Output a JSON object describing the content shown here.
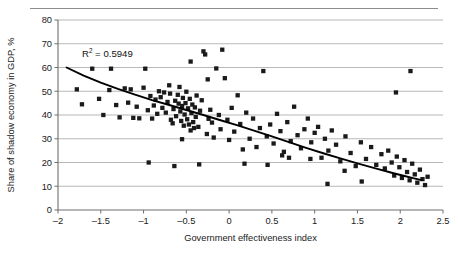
{
  "figure": {
    "top_rule": true,
    "annotation": {
      "r2_prefix": "R",
      "r2_sup": "2",
      "r2_value": "= 0.5949",
      "full_text": "R2 = 0.5949"
    }
  },
  "chart_data": {
    "type": "scatter",
    "title": "",
    "xlabel": "Government effectiveness index",
    "ylabel": "Share of shadow economy in GDP, %",
    "xlim": [
      -2,
      2.5
    ],
    "ylim": [
      0,
      80
    ],
    "xticks": [
      -2,
      -1.5,
      -1,
      -0.5,
      0,
      0.5,
      1,
      1.5,
      2,
      2.5
    ],
    "xticklabels": [
      "–2",
      "–1.5",
      "–1",
      "–0.5",
      "0",
      "0.5",
      "1",
      "1.5",
      "2",
      "2.5"
    ],
    "yticks": [
      0,
      10,
      20,
      30,
      40,
      50,
      60,
      70,
      80
    ],
    "yticklabels": [
      "0",
      "10",
      "20",
      "30",
      "40",
      "50",
      "60",
      "70",
      "80"
    ],
    "grid": "horizontal",
    "legend": "none",
    "marker": "square",
    "marker_color": "#1a1a1a",
    "annotations": [
      {
        "text": "R2 = 0.5949",
        "x": -1.72,
        "y": 64.5
      }
    ],
    "trendline": {
      "type": "power",
      "color": "#000000",
      "r_squared": 0.5949,
      "points": [
        [
          -1.9,
          60.0
        ],
        [
          -1.7,
          56.6
        ],
        [
          -1.5,
          53.6
        ],
        [
          -1.3,
          51.0
        ],
        [
          -1.1,
          48.6
        ],
        [
          -0.9,
          46.3
        ],
        [
          -0.7,
          44.2
        ],
        [
          -0.5,
          42.1
        ],
        [
          -0.3,
          40.0
        ],
        [
          -0.1,
          37.8
        ],
        [
          0.1,
          35.6
        ],
        [
          0.3,
          33.3
        ],
        [
          0.5,
          31.0
        ],
        [
          0.7,
          28.6
        ],
        [
          0.9,
          26.2
        ],
        [
          1.1,
          23.9
        ],
        [
          1.3,
          21.7
        ],
        [
          1.5,
          19.6
        ],
        [
          1.7,
          17.6
        ],
        [
          1.9,
          15.7
        ],
        [
          2.05,
          14.3
        ],
        [
          2.15,
          13.4
        ],
        [
          2.25,
          12.6
        ]
      ]
    },
    "x": [
      -1.78,
      -1.72,
      -1.6,
      -1.52,
      -1.47,
      -1.4,
      -1.32,
      -1.28,
      -1.22,
      -1.18,
      -1.12,
      -1.08,
      -1.05,
      -1.0,
      -0.98,
      -0.95,
      -0.92,
      -0.9,
      -0.88,
      -0.86,
      -0.84,
      -0.82,
      -0.8,
      -0.78,
      -0.76,
      -0.74,
      -0.72,
      -0.7,
      -0.69,
      -0.68,
      -0.66,
      -0.65,
      -0.63,
      -0.62,
      -0.6,
      -0.59,
      -0.58,
      -0.57,
      -0.56,
      -0.55,
      -0.54,
      -0.53,
      -0.52,
      -0.51,
      -0.5,
      -0.49,
      -0.48,
      -0.47,
      -0.46,
      -0.45,
      -0.44,
      -0.43,
      -0.42,
      -0.41,
      -0.4,
      -0.39,
      -0.38,
      -0.36,
      -0.34,
      -0.32,
      -0.3,
      -0.28,
      -0.26,
      -0.24,
      -0.22,
      -0.2,
      -0.18,
      -0.15,
      -0.12,
      -0.1,
      -0.08,
      -0.05,
      -0.02,
      0.0,
      0.03,
      0.06,
      0.1,
      0.13,
      0.16,
      0.2,
      0.24,
      0.28,
      0.32,
      0.36,
      0.4,
      0.44,
      0.48,
      0.52,
      0.56,
      0.6,
      0.64,
      0.68,
      0.72,
      0.76,
      0.8,
      0.84,
      0.88,
      0.92,
      0.96,
      1.0,
      1.04,
      1.08,
      1.12,
      1.16,
      1.2,
      1.25,
      1.3,
      1.36,
      1.42,
      1.48,
      1.54,
      1.6,
      1.66,
      1.72,
      1.78,
      1.82,
      1.86,
      1.9,
      1.93,
      1.96,
      1.99,
      2.02,
      2.05,
      2.08,
      2.11,
      2.14,
      2.17,
      2.2,
      2.23,
      2.26,
      2.29,
      2.32,
      -1.38,
      -1.15,
      -0.94,
      -0.64,
      -0.45,
      -0.25,
      0.18,
      0.7,
      1.15,
      1.55,
      1.95,
      2.12,
      0.45,
      0.95,
      1.35,
      -0.35,
      -0.55,
      0.62
    ],
    "y": [
      50.8,
      44.5,
      59.5,
      46.8,
      40.0,
      50.5,
      44.2,
      39.0,
      51.2,
      45.2,
      38.8,
      43.5,
      38.6,
      51.5,
      59.5,
      42.0,
      48.0,
      38.5,
      44.0,
      46.5,
      40.5,
      50.0,
      47.5,
      43.0,
      49.5,
      41.0,
      45.5,
      52.5,
      49.0,
      38.0,
      36.5,
      42.5,
      46.0,
      39.5,
      48.5,
      44.8,
      51.8,
      41.5,
      37.5,
      43.8,
      47.2,
      35.5,
      40.2,
      45.0,
      49.8,
      38.2,
      42.8,
      36.0,
      46.8,
      33.5,
      40.8,
      44.4,
      37.0,
      34.5,
      43.2,
      39.2,
      48.2,
      35.0,
      41.8,
      46.2,
      66.8,
      65.5,
      32.0,
      38.4,
      42.2,
      36.8,
      30.5,
      59.6,
      40.0,
      34.0,
      67.5,
      55.5,
      38.0,
      29.5,
      43.0,
      33.0,
      48.3,
      36.2,
      25.5,
      41.0,
      30.0,
      38.5,
      26.5,
      34.5,
      58.5,
      31.0,
      36.0,
      28.0,
      40.5,
      33.2,
      24.5,
      37.0,
      29.0,
      43.5,
      31.5,
      26.0,
      34.0,
      38.5,
      28.5,
      32.5,
      35.0,
      22.0,
      30.0,
      25.0,
      33.5,
      27.5,
      20.5,
      31.0,
      24.0,
      18.5,
      28.5,
      21.5,
      26.5,
      19.0,
      23.5,
      17.5,
      25.0,
      20.0,
      14.5,
      22.5,
      18.0,
      13.5,
      21.0,
      16.0,
      12.5,
      19.5,
      15.0,
      11.5,
      17.0,
      13.0,
      10.5,
      14.0,
      59.5,
      50.8,
      20.0,
      18.5,
      62.5,
      55.0,
      19.5,
      22.0,
      11.0,
      12.0,
      49.5,
      58.5,
      19.0,
      21.5,
      16.5,
      19.2,
      29.8,
      23.0
    ]
  }
}
